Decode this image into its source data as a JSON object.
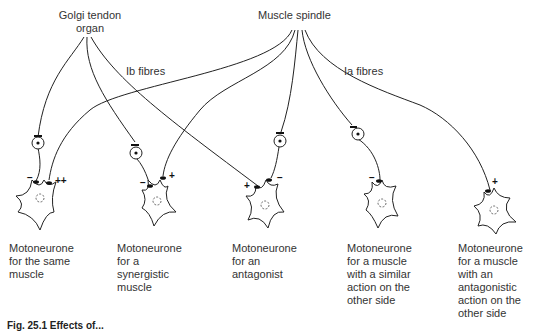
{
  "sources": {
    "golgi": "Golgi tendon\norgan",
    "spindle": "Muscle spindle"
  },
  "fibres": {
    "ib": "Ib fibres",
    "ia": "Ia fibres"
  },
  "motoneurones": [
    {
      "label": "Motoneurone\nfor the same\nmuscle",
      "signs": [
        "−",
        "++"
      ]
    },
    {
      "label": "Motoneurone\nfor a\nsynergistic\nmuscle",
      "signs": [
        "−",
        "+"
      ]
    },
    {
      "label": "Motoneurone\nfor an\nantagonist",
      "signs": [
        "+",
        "−"
      ]
    },
    {
      "label": "Motoneurone\nfor a muscle\nwith a similar\naction on the\nother side",
      "signs": [
        "−"
      ]
    },
    {
      "label": "Motoneurone\nfor a muscle\nwith an\nantagonistic\naction on the\nother side",
      "signs": [
        "+"
      ]
    }
  ],
  "caption": "Fig. 25.1 Effects of..."
}
